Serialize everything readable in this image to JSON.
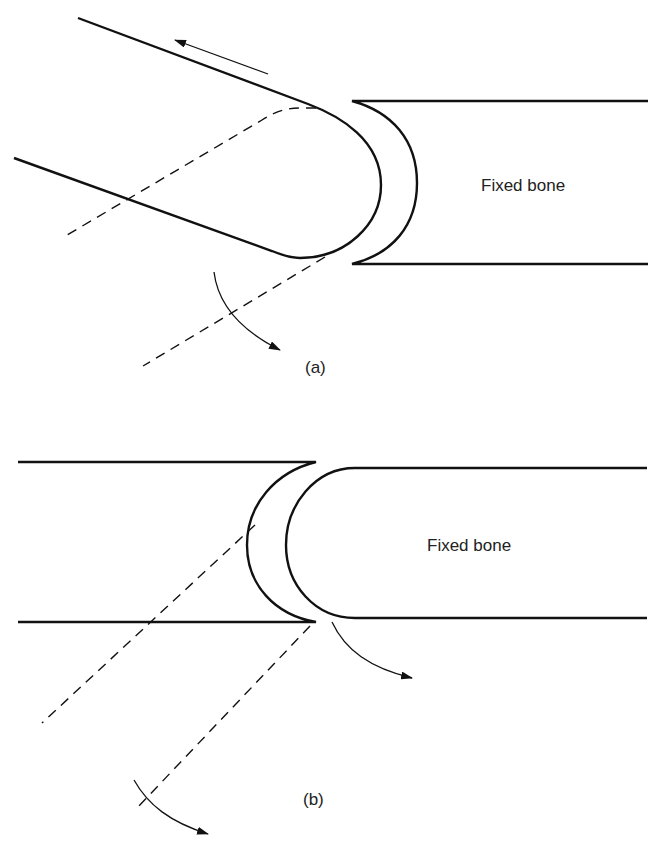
{
  "panels": [
    {
      "id": "a",
      "caption": "(a)",
      "region_label": "Fixed bone",
      "description": "Rounded moving bone tip against concave fixed bone surface; straight arrow indicates sliding, curved arrow indicates rotation; dashed lines show displaced position"
    },
    {
      "id": "b",
      "caption": "(b)",
      "region_label": "Fixed bone",
      "description": "Concave moving bone end against convex fixed bone; curved arrows indicate rotation; dashed lines show displaced position"
    }
  ],
  "colors": {
    "line": "#111111",
    "background": "#ffffff"
  }
}
